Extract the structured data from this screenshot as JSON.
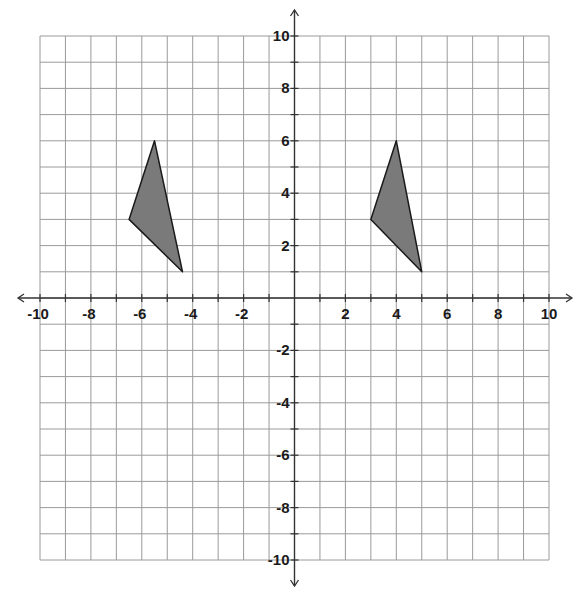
{
  "diagram": {
    "type": "coordinate-plane",
    "x_range": [
      -10,
      10
    ],
    "y_range": [
      -10,
      10
    ],
    "grid_step": 1,
    "label_step": 2,
    "x_labels": [
      "-10",
      "-8",
      "-6",
      "-4",
      "-2",
      "2",
      "4",
      "6",
      "8",
      "10"
    ],
    "y_labels": [
      "10",
      "8",
      "6",
      "4",
      "2",
      "-2",
      "-4",
      "-6",
      "-8",
      "-10"
    ],
    "colors": {
      "grid": "#9a9a9a",
      "axis": "#333333",
      "shape_fill": "#7a7a7a",
      "shape_stroke": "#1a1a1a"
    },
    "shapes": [
      {
        "name": "triangle-left",
        "vertices": [
          [
            -5.5,
            6
          ],
          [
            -6.5,
            3
          ],
          [
            -4.4,
            1
          ]
        ]
      },
      {
        "name": "triangle-right",
        "vertices": [
          [
            4,
            6
          ],
          [
            3,
            3
          ],
          [
            5,
            1
          ]
        ]
      }
    ]
  }
}
